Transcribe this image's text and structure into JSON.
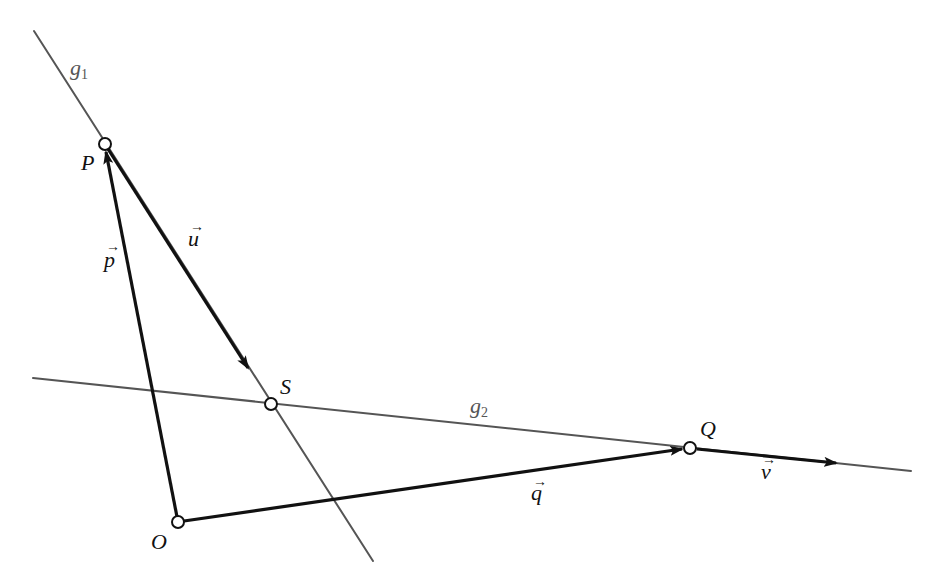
{
  "diagram": {
    "type": "vector-geometry",
    "colors": {
      "background": "#ffffff",
      "line": "#555555",
      "vector": "#111111"
    },
    "points": [
      {
        "id": "P",
        "label": "P",
        "x": 105,
        "y": 144
      },
      {
        "id": "S",
        "label": "S",
        "x": 271,
        "y": 404
      },
      {
        "id": "O",
        "label": "O",
        "x": 178,
        "y": 522
      },
      {
        "id": "Q",
        "label": "Q",
        "x": 690,
        "y": 448
      }
    ],
    "lines": [
      {
        "id": "g1",
        "label_main": "g",
        "label_sub": "1",
        "from": [
          34,
          31
        ],
        "to": [
          373,
          561
        ]
      },
      {
        "id": "g2",
        "label_main": "g",
        "label_sub": "2",
        "from": [
          33,
          378
        ],
        "to": [
          911,
          471
        ]
      }
    ],
    "vectors": [
      {
        "id": "p",
        "label": "p",
        "from": "O",
        "to": "P"
      },
      {
        "id": "u",
        "label": "u",
        "from": "P",
        "to_xy": [
          248,
          368
        ]
      },
      {
        "id": "q",
        "label": "q",
        "from": "O",
        "to": "Q"
      },
      {
        "id": "v",
        "label": "v",
        "from": "Q",
        "to_xy": [
          835,
          463
        ]
      }
    ],
    "vector_arrow_glyph": "→"
  }
}
